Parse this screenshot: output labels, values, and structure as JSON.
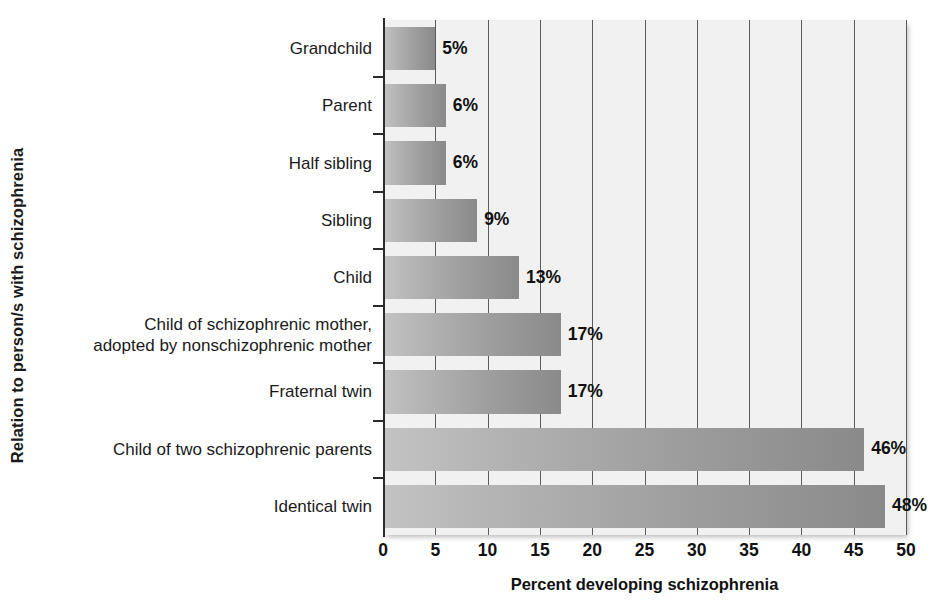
{
  "chart_data": {
    "type": "bar",
    "orientation": "horizontal",
    "title": "",
    "xlabel": "Percent developing schizophrenia",
    "ylabel": "Relation to person/s with schizophrenia",
    "xlim": [
      0,
      50
    ],
    "xticks": [
      0,
      5,
      10,
      15,
      20,
      25,
      30,
      35,
      40,
      45,
      50
    ],
    "xtick_labels": [
      "0",
      "5",
      "10",
      "15",
      "20",
      "25",
      "30",
      "35",
      "40",
      "45",
      "50"
    ],
    "grid": true,
    "legend": "none",
    "categories": [
      "Grandchild",
      "Parent",
      "Half sibling",
      "Sibling",
      "Child",
      "Child of schizophrenic mother,\nadopted by nonschizophrenic mother",
      "Fraternal twin",
      "Child of two schizophrenic parents",
      "Identical twin"
    ],
    "values": [
      5,
      6,
      6,
      9,
      13,
      17,
      17,
      46,
      48
    ],
    "value_labels": [
      "5%",
      "6%",
      "6%",
      "9%",
      "13%",
      "17%",
      "17%",
      "46%",
      "48%"
    ],
    "bar_color_start": "#c3c3c3",
    "bar_color_end": "#8a8a8a",
    "plot_background": "#f1f1f1",
    "gridline_color": "#5b5b5b",
    "axis_color": "#2b2b2b"
  }
}
